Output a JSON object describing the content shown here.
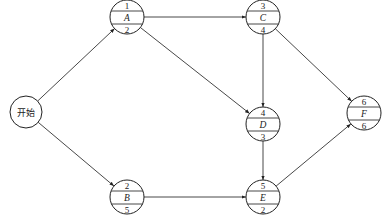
{
  "diagram": {
    "type": "activity-on-node network",
    "start": {
      "id": "start",
      "label": "开始"
    },
    "nodes": [
      {
        "id": "A",
        "label": "A",
        "top": "1",
        "bottom": "2"
      },
      {
        "id": "B",
        "label": "B",
        "top": "2",
        "bottom": "5"
      },
      {
        "id": "C",
        "label": "C",
        "top": "3",
        "bottom": "4"
      },
      {
        "id": "D",
        "label": "D",
        "top": "4",
        "bottom": "3"
      },
      {
        "id": "E",
        "label": "E",
        "top": "5",
        "bottom": "2"
      },
      {
        "id": "F",
        "label": "F",
        "top": "6",
        "bottom": "6"
      }
    ],
    "edges": [
      {
        "from": "start",
        "to": "A"
      },
      {
        "from": "start",
        "to": "B"
      },
      {
        "from": "A",
        "to": "C"
      },
      {
        "from": "A",
        "to": "D"
      },
      {
        "from": "C",
        "to": "D"
      },
      {
        "from": "C",
        "to": "F"
      },
      {
        "from": "D",
        "to": "E"
      },
      {
        "from": "B",
        "to": "E"
      },
      {
        "from": "E",
        "to": "F"
      }
    ]
  }
}
